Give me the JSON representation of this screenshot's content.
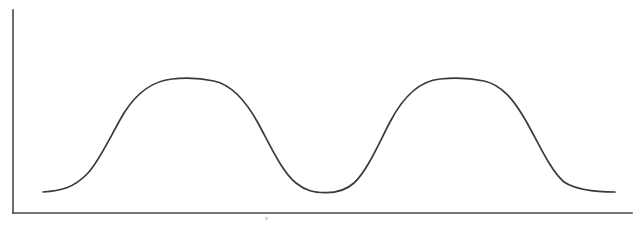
{
  "figure": {
    "name": "bimodal-distribution-curve",
    "background_color": "#ffffff",
    "width": 637,
    "height": 229,
    "title": "",
    "has_ticks": false,
    "has_tick_labels": false,
    "has_legend": false,
    "has_gridlines": false
  },
  "axes": {
    "line_color": "#4a4a4a",
    "stroke_width": 1.6,
    "origin_x": 13,
    "origin_y": 213,
    "y_axis_top": 10,
    "x_axis_right": 632,
    "x_label": "",
    "y_label": ""
  },
  "curve": {
    "color": "#3a3a3a",
    "stroke_width": 1.7,
    "label": "",
    "path": "M 43 192 C 60 191 74 188 88 173 C 100 160 112 133 124 113 C 136 94 152 81 172 79 C 186 77.5 200 78 214 81 C 232 85 246 101 258 123 C 270 145 282 172 296 183 C 306 191 314 192.5 325 192.7 C 336 192.9 345 191 354 183 C 367 171 378 145 390 122 C 402 99 418 81 440 79 C 456 77.5 470 78 484 81 C 502 85 514 100 526 121 C 538 142 550 170 564 182 C 578 191 598 192 615 192"
  },
  "scan_artifact": {
    "present": true,
    "color": "#d8d8d8",
    "x": 265,
    "y": 217,
    "width": 3,
    "height": 3
  },
  "chart_data": {
    "type": "line",
    "title": "",
    "subtitle": "",
    "xlabel": "",
    "ylabel": "",
    "legend_position": "none",
    "grid": false,
    "axis_ticks": [],
    "annotations": [],
    "series": [
      {
        "name": "bimodal-curve",
        "color": "#3a3a3a",
        "x": [
          43,
          60,
          80,
          100,
          120,
          140,
          160,
          190,
          220,
          240,
          260,
          280,
          300,
          325,
          350,
          370,
          390,
          410,
          430,
          450,
          478,
          500,
          520,
          540,
          560,
          580,
          600,
          615
        ],
        "y": [
          192,
          191,
          181,
          160,
          119,
          101,
          85,
          79,
          83,
          93,
          125,
          157,
          186,
          193,
          188,
          167,
          121,
          97,
          85,
          80,
          79,
          85,
          110,
          142,
          178,
          188,
          191,
          192
        ]
      }
    ],
    "features": {
      "peaks": [
        {
          "label": "first-peak",
          "x": 190,
          "y": 79
        },
        {
          "label": "second-peak",
          "x": 478,
          "y": 79
        }
      ],
      "valleys": [
        {
          "label": "central-trough",
          "x": 325,
          "y": 193
        }
      ],
      "endpoints": [
        {
          "label": "left-endpoint",
          "x": 43,
          "y": 192
        },
        {
          "label": "right-endpoint",
          "x": 615,
          "y": 192
        }
      ]
    },
    "xlim": [
      13,
      632
    ],
    "ylim": [
      213,
      10
    ]
  }
}
